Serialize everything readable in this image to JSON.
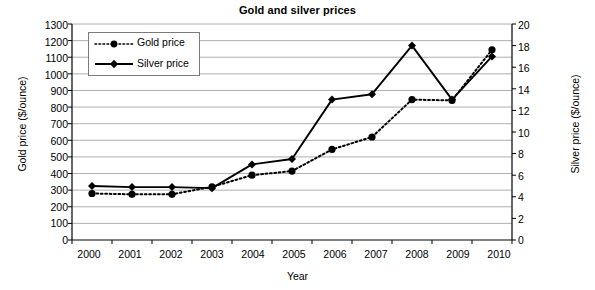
{
  "chart_data": {
    "type": "line",
    "title": "Gold and silver prices",
    "xlabel": "Year",
    "ylabel": "Gold price ($/ounce)",
    "ylabel_secondary": "Silver price ($/ounce)",
    "categories": [
      "2000",
      "2001",
      "2002",
      "2003",
      "2004",
      "2005",
      "2006",
      "2007",
      "2008",
      "2009",
      "2010"
    ],
    "x": [
      2000,
      2001,
      2002,
      2003,
      2004,
      2005,
      2006,
      2007,
      2008,
      2009,
      2010
    ],
    "ylim": [
      0,
      1300
    ],
    "ylim_secondary": [
      0,
      20
    ],
    "yticks": [
      0,
      100,
      200,
      300,
      400,
      500,
      600,
      700,
      800,
      900,
      1000,
      1100,
      1200,
      1300
    ],
    "yticks_secondary": [
      0,
      2,
      4,
      6,
      8,
      10,
      12,
      14,
      16,
      18,
      20
    ],
    "grid": true,
    "grid_axis": "y",
    "legend_position": "upper-left",
    "series": [
      {
        "name": "Gold price",
        "axis": "left",
        "unit": "$/ounce",
        "line_style": "dotted",
        "marker": "circle",
        "color": "#000000",
        "values": [
          280,
          275,
          275,
          320,
          390,
          415,
          545,
          620,
          845,
          840,
          1145
        ]
      },
      {
        "name": "Silver price",
        "axis": "right",
        "unit": "$/ounce",
        "line_style": "solid",
        "marker": "diamond",
        "color": "#000000",
        "values": [
          5.0,
          4.9,
          4.9,
          4.8,
          7.0,
          7.5,
          13.0,
          13.5,
          18.0,
          13.0,
          17.0
        ]
      }
    ]
  },
  "legend": {
    "items": [
      {
        "label": "Gold price",
        "style": "dotted-circle"
      },
      {
        "label": "Silver price",
        "style": "solid-diamond"
      }
    ]
  },
  "axes": {
    "left_title": "Gold price ($/ounce)",
    "right_title": "Silver price ($/ounce)",
    "bottom_title": "Year"
  },
  "colors": {
    "series": "#000000",
    "grid": "#9a9a9a",
    "axis": "#000000",
    "background": "#ffffff"
  }
}
